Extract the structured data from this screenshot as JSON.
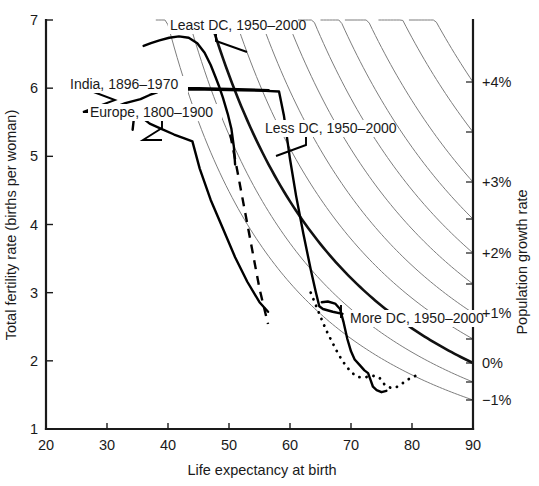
{
  "chart_data": {
    "type": "line",
    "title": "",
    "xlabel": "Life expectancy at birth",
    "ylabel": "Total fertility rate (births per woman)",
    "ylabel_right": "Population growth rate",
    "xlim": [
      20,
      90
    ],
    "ylim": [
      1,
      7
    ],
    "xticks": [
      20,
      30,
      40,
      50,
      60,
      70,
      80,
      90
    ],
    "xticklabels": [
      "20",
      "30",
      "40",
      "50",
      "60",
      "70",
      "80",
      "90"
    ],
    "yticks": [
      1,
      2,
      3,
      4,
      5,
      6,
      7
    ],
    "yticklabels": [
      "1",
      "2",
      "3",
      "4",
      "5",
      "6",
      "7"
    ],
    "right_axis_ticks": [
      {
        "value": 4,
        "label": "+4%",
        "y_px": 82
      },
      {
        "value": 3,
        "label": "+3%",
        "y_px": 182
      },
      {
        "value": 2,
        "label": "+2%",
        "y_px": 253
      },
      {
        "value": 1,
        "label": "+1%",
        "y_px": 313
      },
      {
        "value": 0,
        "label": "0%",
        "y_px": 363
      },
      {
        "value": -1,
        "label": "−1%",
        "y_px": 400
      }
    ],
    "grid": false,
    "legend_position": "inline-annotations",
    "isolines_note": "Hyperbolic contours of constant population growth rate; the bold contour is 0% (replacement).",
    "series": [
      {
        "name": "Least DC, 1950–2000",
        "style": "solid",
        "label": "Least DC, 1950–2000",
        "label_x": 47.5,
        "label_y": 7.02,
        "points": [
          [
            36.0,
            6.62
          ],
          [
            37.2,
            6.66
          ],
          [
            38.6,
            6.7
          ],
          [
            40.2,
            6.74
          ],
          [
            41.8,
            6.76
          ],
          [
            43.4,
            6.74
          ],
          [
            44.8,
            6.66
          ],
          [
            46.0,
            6.52
          ],
          [
            47.0,
            6.34
          ],
          [
            47.8,
            6.16
          ],
          [
            48.4,
            6.02
          ],
          [
            49.0,
            5.86
          ],
          [
            49.8,
            5.62
          ],
          [
            50.4,
            5.4
          ],
          [
            50.8,
            5.14
          ],
          [
            51.0,
            4.88
          ]
        ]
      },
      {
        "name": "Less DC, 1950–2000",
        "style": "solid",
        "label": "Less DC, 1950–2000",
        "label_x": 61.0,
        "label_y": 5.45,
        "points": [
          [
            41.0,
            5.98
          ],
          [
            46.0,
            5.98
          ],
          [
            52.0,
            5.97
          ],
          [
            56.0,
            5.96
          ],
          [
            58.2,
            5.95
          ],
          [
            59.0,
            5.6
          ],
          [
            60.0,
            4.96
          ],
          [
            61.0,
            4.42
          ],
          [
            62.2,
            3.86
          ],
          [
            63.4,
            3.34
          ],
          [
            64.2,
            3.02
          ],
          [
            64.8,
            2.8
          ],
          [
            65.4,
            2.76
          ],
          [
            67.0,
            2.72
          ],
          [
            68.6,
            2.69
          ]
        ]
      },
      {
        "name": "Europe, 1800–1900",
        "style": "solid",
        "label": "Europe, 1800–1900",
        "label_x": 32.0,
        "label_y": 5.62,
        "points": [
          [
            34.2,
            5.39
          ],
          [
            34.4,
            5.55
          ],
          [
            36.0,
            5.55
          ],
          [
            37.0,
            5.48
          ],
          [
            39.0,
            5.4
          ],
          [
            41.0,
            5.32
          ],
          [
            42.8,
            5.26
          ],
          [
            44.0,
            5.22
          ],
          [
            45.2,
            4.82
          ],
          [
            47.0,
            4.36
          ],
          [
            49.0,
            3.94
          ],
          [
            51.0,
            3.52
          ],
          [
            53.0,
            3.16
          ],
          [
            55.0,
            2.86
          ],
          [
            56.4,
            2.72
          ]
        ]
      },
      {
        "name": "India, 1896–1970",
        "style": "solid",
        "label": "India, 1896–1970",
        "label_x": 28.5,
        "label_y": 6.12,
        "points": [
          [
            27.5,
            5.7
          ],
          [
            31.0,
            5.71
          ],
          [
            33.0,
            5.78
          ],
          [
            35.5,
            5.84
          ],
          [
            37.0,
            5.9
          ],
          [
            38.2,
            5.94
          ],
          [
            39.0,
            6.0
          ],
          [
            45.0,
            6.0
          ],
          [
            50.0,
            5.99
          ],
          [
            53.0,
            5.98
          ],
          [
            56.5,
            5.97
          ]
        ]
      },
      {
        "name": "India projection",
        "style": "dashed",
        "label": "",
        "points": [
          [
            50.2,
            5.32
          ],
          [
            51.0,
            4.96
          ],
          [
            51.8,
            4.58
          ],
          [
            52.6,
            4.2
          ],
          [
            53.4,
            3.82
          ],
          [
            54.2,
            3.44
          ],
          [
            55.0,
            3.06
          ],
          [
            55.8,
            2.76
          ],
          [
            56.4,
            2.54
          ]
        ]
      },
      {
        "name": "More DC, 1950–2000",
        "style": "solid",
        "label": "More DC, 1950–2000",
        "label_x": 69.0,
        "label_y": 2.72,
        "points": [
          [
            65.2,
            2.86
          ],
          [
            66.2,
            2.87
          ],
          [
            67.4,
            2.84
          ],
          [
            68.2,
            2.76
          ],
          [
            68.8,
            2.56
          ],
          [
            69.4,
            2.32
          ],
          [
            70.0,
            2.14
          ],
          [
            70.6,
            2.02
          ],
          [
            71.4,
            1.94
          ],
          [
            72.2,
            1.86
          ],
          [
            72.8,
            1.82
          ],
          [
            73.2,
            1.72
          ],
          [
            73.6,
            1.62
          ],
          [
            74.2,
            1.57
          ],
          [
            75.0,
            1.54
          ],
          [
            75.8,
            1.56
          ]
        ]
      },
      {
        "name": "More DC projection",
        "style": "dotted",
        "label": "",
        "points": [
          [
            63.4,
            3.0
          ],
          [
            64.4,
            2.78
          ],
          [
            65.4,
            2.56
          ],
          [
            66.2,
            2.4
          ],
          [
            67.0,
            2.26
          ],
          [
            67.8,
            2.12
          ],
          [
            68.6,
            2.0
          ],
          [
            69.4,
            1.9
          ],
          [
            70.2,
            1.82
          ],
          [
            71.2,
            1.76
          ],
          [
            72.4,
            1.76
          ],
          [
            73.6,
            1.78
          ],
          [
            74.6,
            1.76
          ],
          [
            75.6,
            1.64
          ],
          [
            76.6,
            1.6
          ],
          [
            77.6,
            1.62
          ],
          [
            78.6,
            1.68
          ],
          [
            79.6,
            1.74
          ],
          [
            80.6,
            1.78
          ]
        ]
      }
    ],
    "annotations": [
      {
        "text": "Least DC, 1950–2000",
        "kind": "series-label"
      },
      {
        "text": "Less DC, 1950–2000",
        "kind": "series-label"
      },
      {
        "text": "Europe, 1800–1900",
        "kind": "series-label"
      },
      {
        "text": "India, 1896–1970",
        "kind": "series-label"
      },
      {
        "text": "More DC, 1950–2000",
        "kind": "series-label"
      }
    ]
  },
  "labels": {
    "y_axis_title": "Total fertility rate (births per woman)",
    "y_axis_title_right": "Population growth rate",
    "x_axis_title": "Life expectancy at birth",
    "series_least_dc": "Least DC, 1950–2000",
    "series_less_dc": "Less DC, 1950–2000",
    "series_europe": "Europe, 1800–1900",
    "series_india": "India, 1896–1970",
    "series_more_dc": "More DC, 1950–2000",
    "x_tick_20": "20",
    "x_tick_30": "30",
    "x_tick_40": "40",
    "x_tick_50": "50",
    "x_tick_60": "60",
    "x_tick_70": "70",
    "x_tick_80": "80",
    "x_tick_90": "90",
    "y_tick_1": "1",
    "y_tick_2": "2",
    "y_tick_3": "3",
    "y_tick_4": "4",
    "y_tick_5": "5",
    "y_tick_6": "6",
    "y_tick_7": "7",
    "r_tick_p4": "+4%",
    "r_tick_p3": "+3%",
    "r_tick_p2": "+2%",
    "r_tick_p1": "+1%",
    "r_tick_0": "0%",
    "r_tick_m1": "−1%"
  },
  "colors": {
    "background": "#ffffff",
    "axis": "#1a1a1a",
    "isoline": "#7d7d7d",
    "isoline_zero": "#111111",
    "series": "#000000"
  }
}
